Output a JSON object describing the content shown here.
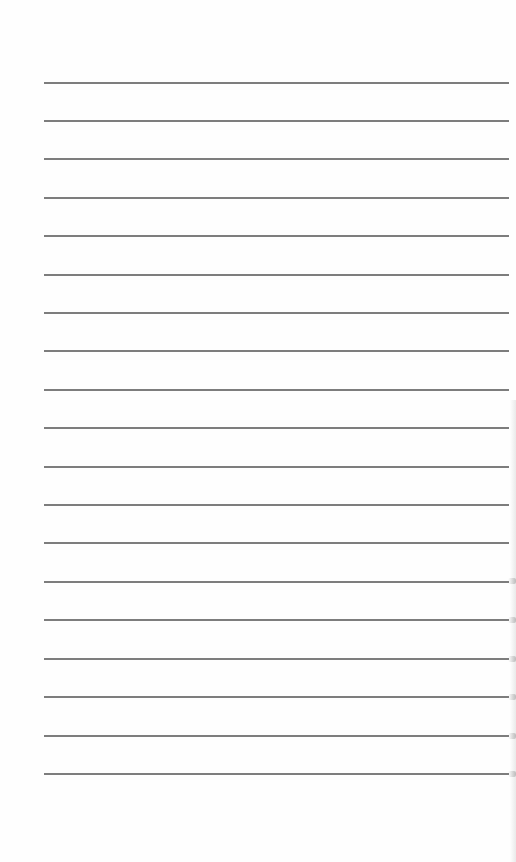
{
  "page": {
    "type": "blank-lined-sheet",
    "background_color": "#fefefe",
    "rule_color": "#6f6f6f",
    "rule_count": 19,
    "rule_x_start": 44,
    "rule_x_end": 509,
    "rule_first_y": 82,
    "rule_spacing": 38.4,
    "rules_y": [
      82,
      120,
      158,
      197,
      235,
      274,
      312,
      350,
      389,
      427,
      466,
      504,
      542,
      581,
      619,
      658,
      696,
      735,
      773
    ],
    "edge_marks_y": [
      580,
      619,
      658,
      696,
      735,
      773
    ],
    "text": []
  }
}
